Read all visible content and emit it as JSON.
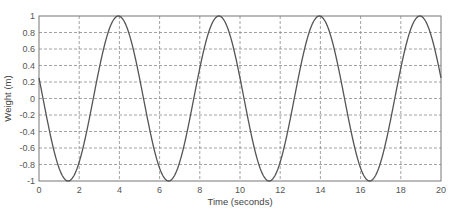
{
  "chart_data": {
    "type": "line",
    "title": "",
    "xlabel": "Time (seconds)",
    "ylabel": "Weight (m)",
    "xlim": [
      0,
      20
    ],
    "ylim": [
      -1,
      1
    ],
    "xticks": [
      0,
      2,
      4,
      6,
      8,
      10,
      12,
      14,
      16,
      18,
      20
    ],
    "yticks": [
      -1,
      -0.8,
      -0.6,
      -0.4,
      -0.2,
      0,
      0.2,
      0.4,
      0.6,
      0.8,
      1
    ],
    "ytick_labels": [
      "-1",
      "-0.8",
      "-0.6",
      "-0.4",
      "-0.2",
      "0",
      "0.2",
      "0.4",
      "0.6",
      "0.8",
      "1"
    ],
    "grid": true,
    "grid_style": "dashed",
    "legend": null,
    "series": [
      {
        "name": "weight",
        "color": "#555555",
        "function": "cos(2*pi*(t - 3.95)/5)",
        "amplitude": 1,
        "period": 5,
        "phase_peak_t": 3.95,
        "peaks_t": [
          3.95,
          8.95,
          13.95,
          18.95
        ],
        "troughs_t": [
          1.45,
          6.45,
          11.45,
          16.45
        ],
        "x": [
          0,
          0.5,
          1,
          1.45,
          2,
          2.5,
          3,
          3.5,
          3.95,
          4.5,
          5,
          5.5,
          6,
          6.45,
          7,
          7.5,
          8,
          8.5,
          8.95,
          9.5,
          10,
          10.5,
          11,
          11.45,
          12,
          12.5,
          13,
          13.5,
          13.95,
          14.5,
          15,
          15.5,
          16,
          16.45,
          17,
          17.5,
          18,
          18.5,
          18.95,
          19.5,
          20
        ],
        "values": [
          0.22,
          -0.38,
          -0.87,
          -1.0,
          -0.84,
          -0.43,
          0.13,
          0.63,
          1.0,
          0.94,
          0.61,
          0.08,
          -0.46,
          -1.0,
          -0.94,
          -0.63,
          -0.12,
          0.41,
          1.0,
          0.94,
          0.64,
          0.16,
          -0.44,
          -1.0,
          -0.94,
          -0.62,
          -0.16,
          0.45,
          1.0,
          0.94,
          0.61,
          0.08,
          -0.46,
          -1.0,
          -0.94,
          -0.63,
          -0.12,
          0.41,
          1.0,
          0.94,
          0.16
        ]
      }
    ]
  },
  "layout": {
    "plot_left": 39,
    "plot_top": 16,
    "plot_right": 441,
    "plot_bottom": 181,
    "axis_color": "#777777",
    "grid_color": "#8a8a8a",
    "line_color": "#555555"
  }
}
